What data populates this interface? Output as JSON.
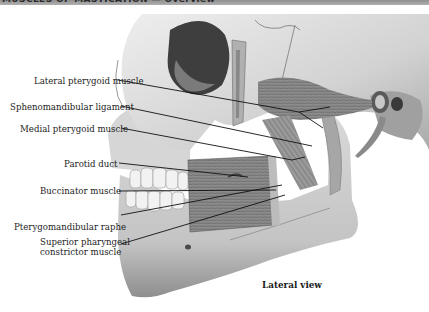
{
  "header": {
    "title": "MUSCLES OF MASTICATION — Overview"
  },
  "figure": {
    "view_label": "Lateral view",
    "colors": {
      "bone_light": "#e4e4e4",
      "bone_mid": "#c2c2c2",
      "bone_shadow": "#8a8a8a",
      "muscle": "#9a9a9a",
      "orbit_dark": "#3e3e3e",
      "leader_line": "#111111"
    },
    "labels": [
      {
        "text": "Lateral pterygoid muscle"
      },
      {
        "text": "Sphenomandibular ligament"
      },
      {
        "text": "Medial pterygoid muscle"
      },
      {
        "text": "Parotid duct"
      },
      {
        "text": "Buccinator muscle"
      },
      {
        "text": "Pterygomandibular raphe"
      },
      {
        "text": "Superior pharyngeal",
        "text2": "constrictor muscle"
      }
    ]
  }
}
